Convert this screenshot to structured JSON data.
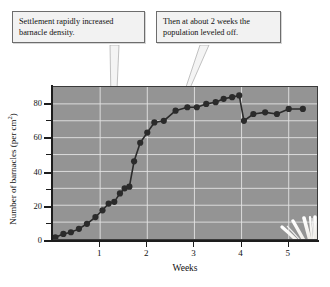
{
  "figure": {
    "background_color": "#ffffff",
    "plot_background_color": "#949494",
    "gridline_color": "#e4e4e4",
    "series_color": "#2b2b2b"
  },
  "annotations": [
    {
      "id": "settlement",
      "line1": "Settlement rapidly increased",
      "line2": "barnacle density."
    },
    {
      "id": "plateau",
      "line1": "Then at about 2 weeks the",
      "line2": "population leveled off."
    }
  ],
  "illustration": {
    "name": "barnacle-illustration",
    "caption": "barnacle"
  },
  "chart_data": {
    "type": "line",
    "title": "",
    "xlabel": "Weeks",
    "ylabel": "Number of barnacles (per cm",
    "ylabel_sup": "2",
    "ylabel_suffix": ")",
    "xlim": [
      0,
      5.6
    ],
    "ylim": [
      0,
      90
    ],
    "grid": true,
    "legend": "none",
    "xticks": [
      1,
      2,
      3,
      4,
      5
    ],
    "xtick_labels": [
      "1",
      "2",
      "3",
      "4",
      "5"
    ],
    "xticks_minor": [
      0.5,
      1.5,
      2.5,
      3.5,
      4.5
    ],
    "yticks": [
      0,
      20,
      40,
      60,
      80
    ],
    "ytick_labels": [
      "0",
      "20",
      "40",
      "60",
      "80"
    ],
    "yticks_minor": [
      10,
      30,
      50,
      70
    ],
    "series": [
      {
        "name": "barnacle density",
        "marker": "filled-circle",
        "x": [
          0.05,
          0.22,
          0.38,
          0.55,
          0.72,
          0.9,
          1.05,
          1.18,
          1.3,
          1.42,
          1.52,
          1.62,
          1.72,
          1.85,
          2.0,
          2.15,
          2.35,
          2.6,
          2.85,
          3.05,
          3.25,
          3.45,
          3.62,
          3.8,
          3.95,
          4.05,
          4.25,
          4.5,
          4.75,
          5.0,
          5.3
        ],
        "y": [
          1,
          3,
          4,
          6,
          9,
          13,
          17,
          21,
          22,
          27,
          30,
          31,
          46,
          57,
          63,
          69,
          70,
          76,
          78,
          78,
          80,
          81,
          83,
          84,
          85,
          70,
          74,
          75,
          74,
          77,
          77
        ]
      }
    ]
  }
}
